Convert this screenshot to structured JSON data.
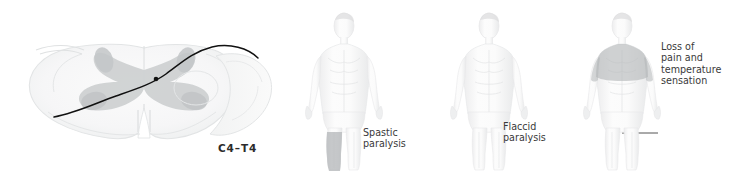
{
  "illustration": {
    "background_color": "#ffffff",
    "text_color": "#3a3a3a",
    "tract_color": "#101010",
    "shading_color": "#b9bcbe"
  },
  "spinal_cord": {
    "level_label": "C4–T4",
    "description": "spinal-cord-cross-section"
  },
  "figures": [
    {
      "id": "figure-spastic",
      "callout": "Spastic\nparalysis",
      "leader_type": "horizontal-line",
      "shaded_region": "left-lower-leg"
    },
    {
      "id": "figure-flaccid",
      "callout": "Flaccid\nparalysis",
      "leader_type": "diagonal-arrow",
      "shaded_region": "none"
    },
    {
      "id": "figure-sensation",
      "callout": "Loss of\npain and\ntemperature\nsensation",
      "leader_type": "horizontal-line",
      "shaded_region": "shoulders-and-upper-chest"
    }
  ]
}
